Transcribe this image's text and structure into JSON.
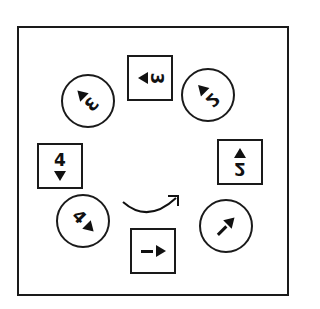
{
  "diagram": {
    "type": "mental-rotation-sequence",
    "frame_color": "#1a1a1a",
    "rotation_arrow": {
      "direction": "clockwise",
      "icon": "curved-arrow-icon"
    },
    "cards": [
      {
        "id": "top",
        "shape": "square",
        "symbol": "3",
        "arrow": "left",
        "rotation_deg": 270,
        "mirrored": true
      },
      {
        "id": "top-right",
        "shape": "circle",
        "symbol": "2",
        "arrow": "up-left",
        "rotation_deg": 315
      },
      {
        "id": "right",
        "shape": "square",
        "symbol": "2",
        "arrow": "up",
        "rotation_deg": 180
      },
      {
        "id": "bottom-right",
        "shape": "circle",
        "symbol": "1",
        "arrow": "up-right",
        "rotation_deg": 45
      },
      {
        "id": "bottom",
        "shape": "square",
        "symbol": "1",
        "arrow": "right",
        "rotation_deg": 90
      },
      {
        "id": "bottom-left",
        "shape": "circle",
        "symbol": "4",
        "arrow": "down-right",
        "rotation_deg": 135
      },
      {
        "id": "left",
        "shape": "square",
        "symbol": "4",
        "arrow": "down",
        "rotation_deg": 0
      },
      {
        "id": "top-left",
        "shape": "circle",
        "symbol": "3",
        "arrow": "down-left",
        "rotation_deg": 225
      }
    ],
    "labels": {
      "top": "3",
      "top_left": "3",
      "top_right": "2",
      "right": "2",
      "bottom_right": "1",
      "bottom": "1",
      "bottom_left": "4",
      "left": "4"
    }
  }
}
